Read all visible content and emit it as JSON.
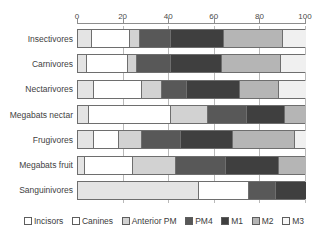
{
  "chart_data": {
    "type": "bar",
    "orientation": "horizontal",
    "stacked": true,
    "normalized_percent": true,
    "title": "",
    "xlabel": "",
    "ylabel": "",
    "xlim": [
      0,
      100
    ],
    "xticks": [
      0,
      20,
      40,
      60,
      80,
      100
    ],
    "xtick_labels": [
      "0",
      "20",
      "40",
      "60",
      "80",
      "100"
    ],
    "grid": true,
    "grid_axis": "x",
    "legend_position": "bottom",
    "categories": [
      "Insectivores",
      "Carnivores",
      "Nectarivores",
      "Megabats nectar",
      "Frugivores",
      "Megabats fruit",
      "Sanguinivores"
    ],
    "series": [
      {
        "name": "Incisors",
        "color": "#e4e4e4",
        "values": [
          6,
          4,
          7,
          5,
          7,
          3,
          53
        ]
      },
      {
        "name": "Canines",
        "color": "#ffffff",
        "values": [
          17,
          18,
          21,
          36,
          11,
          21,
          22
        ]
      },
      {
        "name": "Anterior PM",
        "color": "#d2d2d2",
        "values": [
          4,
          4,
          9,
          16,
          10,
          19,
          0
        ]
      },
      {
        "name": "PM4",
        "color": "#585858",
        "values": [
          14,
          15,
          11,
          17,
          17,
          22,
          12
        ]
      },
      {
        "name": "M1",
        "color": "#3f3f3f",
        "values": [
          23,
          22,
          23,
          17,
          23,
          23,
          13
        ]
      },
      {
        "name": "M2",
        "color": "#b5b5b5",
        "values": [
          26,
          26,
          17,
          9,
          27,
          12,
          0
        ]
      },
      {
        "name": "M3",
        "color": "#f0f0f0",
        "values": [
          10,
          11,
          12,
          0,
          5,
          0,
          0
        ]
      }
    ]
  },
  "legend": {
    "items": [
      {
        "label": "Incisors",
        "color": "#ffffff"
      },
      {
        "label": "Canines",
        "color": "#ffffff"
      },
      {
        "label": "Anterior PM",
        "color": "#d2d2d2"
      },
      {
        "label": "PM4",
        "color": "#585858"
      },
      {
        "label": "M1",
        "color": "#3f3f3f"
      },
      {
        "label": "M2",
        "color": "#b5b5b5"
      },
      {
        "label": "M3",
        "color": "#f7f7f7"
      }
    ]
  },
  "colors": {
    "axis": "#8d8d8d",
    "grid": "#b9b9b9",
    "bar_outline": "#6e6e6e",
    "text": "#3b3b3b",
    "background": "#ffffff"
  }
}
